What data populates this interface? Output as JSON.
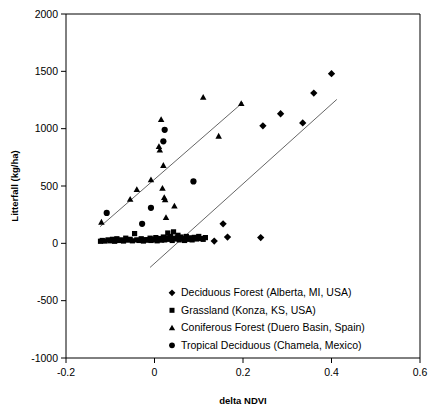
{
  "chart_data": {
    "type": "scatter",
    "title": "",
    "xlabel": "delta NDVI",
    "ylabel": "Litterfall (kg/ha)",
    "xlim": [
      -0.2,
      0.6
    ],
    "ylim": [
      -1000,
      2000
    ],
    "xticks": [
      -0.2,
      0,
      0.2,
      0.4,
      0.6
    ],
    "xtick_labels": [
      "-0.2",
      "0",
      "0.2",
      "0.4",
      "0.6"
    ],
    "yticks": [
      2000,
      1500,
      1000,
      500,
      0,
      -500,
      -1000
    ],
    "ytick_labels": [
      "2000",
      "1500",
      "1000",
      "500",
      "0",
      "-500",
      "-1000"
    ],
    "grid": false,
    "legend_position": "lower-center",
    "series": [
      {
        "name": "Deciduous Forest (Alberta, MI, USA)",
        "marker": "diamond",
        "color": "#000000",
        "points": [
          [
            0.135,
            20
          ],
          [
            0.155,
            170
          ],
          [
            0.165,
            55
          ],
          [
            0.24,
            50
          ],
          [
            0.245,
            1025
          ],
          [
            0.285,
            1130
          ],
          [
            0.335,
            1050
          ],
          [
            0.36,
            1310
          ],
          [
            0.4,
            1480
          ]
        ]
      },
      {
        "name": "Grassland (Konza, KS, USA)",
        "marker": "square",
        "color": "#000000",
        "points": [
          [
            -0.122,
            18
          ],
          [
            -0.118,
            25
          ],
          [
            -0.112,
            20
          ],
          [
            -0.105,
            30
          ],
          [
            -0.1,
            22
          ],
          [
            -0.095,
            35
          ],
          [
            -0.09,
            18
          ],
          [
            -0.085,
            40
          ],
          [
            -0.08,
            25
          ],
          [
            -0.075,
            30
          ],
          [
            -0.07,
            20
          ],
          [
            -0.065,
            45
          ],
          [
            -0.06,
            28
          ],
          [
            -0.055,
            35
          ],
          [
            -0.05,
            22
          ],
          [
            -0.045,
            85
          ],
          [
            -0.04,
            30
          ],
          [
            -0.035,
            25
          ],
          [
            -0.03,
            40
          ],
          [
            -0.025,
            20
          ],
          [
            -0.02,
            32
          ],
          [
            -0.015,
            28
          ],
          [
            -0.01,
            45
          ],
          [
            -0.008,
            25
          ],
          [
            -0.005,
            38
          ],
          [
            0.0,
            30
          ],
          [
            0.003,
            50
          ],
          [
            0.006,
            22
          ],
          [
            0.01,
            35
          ],
          [
            0.013,
            42
          ],
          [
            0.016,
            28
          ],
          [
            0.02,
            55
          ],
          [
            0.023,
            30
          ],
          [
            0.026,
            48
          ],
          [
            0.03,
            90
          ],
          [
            0.033,
            35
          ],
          [
            0.036,
            60
          ],
          [
            0.04,
            25
          ],
          [
            0.043,
            100
          ],
          [
            0.046,
            45
          ],
          [
            0.05,
            38
          ],
          [
            0.053,
            70
          ],
          [
            0.056,
            30
          ],
          [
            0.06,
            55
          ],
          [
            0.064,
            42
          ],
          [
            0.068,
            25
          ],
          [
            0.072,
            60
          ],
          [
            0.076,
            35
          ],
          [
            0.08,
            48
          ],
          [
            0.085,
            30
          ],
          [
            0.09,
            52
          ],
          [
            0.095,
            38
          ],
          [
            0.1,
            60
          ],
          [
            0.105,
            42
          ],
          [
            0.11,
            35
          ],
          [
            0.115,
            50
          ]
        ]
      },
      {
        "name": "Coniferous Forest (Duero Basin, Spain)",
        "marker": "triangle",
        "color": "#000000",
        "points": [
          [
            -0.12,
            185
          ],
          [
            -0.055,
            385
          ],
          [
            -0.04,
            470
          ],
          [
            -0.008,
            555
          ],
          [
            0.01,
            845
          ],
          [
            0.012,
            815
          ],
          [
            0.015,
            1080
          ],
          [
            0.018,
            480
          ],
          [
            0.02,
            680
          ],
          [
            0.022,
            400
          ],
          [
            0.024,
            380
          ],
          [
            0.026,
            225
          ],
          [
            0.045,
            325
          ],
          [
            0.05,
            60
          ],
          [
            0.11,
            1275
          ],
          [
            0.145,
            935
          ],
          [
            0.196,
            1220
          ]
        ]
      },
      {
        "name": "Tropical Deciduous (Chamela, Mexico)",
        "marker": "circle",
        "color": "#000000",
        "points": [
          [
            -0.108,
            265
          ],
          [
            -0.028,
            170
          ],
          [
            -0.008,
            310
          ],
          [
            0.02,
            890
          ],
          [
            0.023,
            990
          ],
          [
            0.088,
            540
          ]
        ]
      }
    ],
    "trend_lines": [
      {
        "name": "coniferous-trend",
        "x1": -0.123,
        "y1": 145,
        "x2": 0.2,
        "y2": 1230
      },
      {
        "name": "deciduous-trend",
        "x1": -0.01,
        "y1": -210,
        "x2": 0.412,
        "y2": 1255
      }
    ]
  }
}
